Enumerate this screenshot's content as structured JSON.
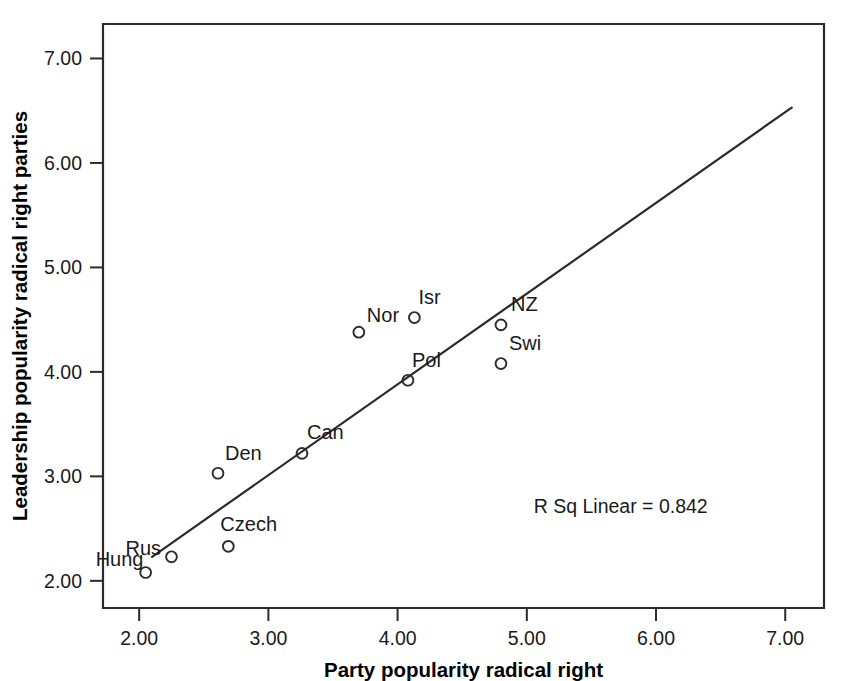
{
  "chart_data": {
    "type": "scatter",
    "title": "",
    "xlabel": "Party popularity radical right",
    "ylabel": "Leadership popularity radical right parties",
    "xlim": [
      1.72,
      7.3
    ],
    "ylim": [
      1.74,
      7.33
    ],
    "xticks": [
      "2.00",
      "3.00",
      "4.00",
      "5.00",
      "6.00",
      "7.00"
    ],
    "xtick_values": [
      2,
      3,
      4,
      5,
      6,
      7
    ],
    "yticks": [
      "2.00",
      "3.00",
      "4.00",
      "5.00",
      "6.00",
      "7.00"
    ],
    "ytick_values": [
      2,
      3,
      4,
      5,
      6,
      7
    ],
    "grid": false,
    "legend": null,
    "points": [
      {
        "label": "Hung",
        "x": 2.05,
        "y": 2.08,
        "label_dx": -50,
        "label_dy": -6
      },
      {
        "label": "Rus",
        "x": 2.25,
        "y": 2.23,
        "label_dx": -46,
        "label_dy": -2
      },
      {
        "label": "Czech",
        "x": 2.69,
        "y": 2.33,
        "label_dx": -8,
        "label_dy": -15
      },
      {
        "label": "Den",
        "x": 2.61,
        "y": 3.03,
        "label_dx": 7,
        "label_dy": -13
      },
      {
        "label": "Can",
        "x": 3.26,
        "y": 3.22,
        "label_dx": 5,
        "label_dy": -14
      },
      {
        "label": "Pol",
        "x": 4.08,
        "y": 3.92,
        "label_dx": 4,
        "label_dy": -13
      },
      {
        "label": "Nor",
        "x": 3.7,
        "y": 4.38,
        "label_dx": 8,
        "label_dy": -10
      },
      {
        "label": "Isr",
        "x": 4.13,
        "y": 4.52,
        "label_dx": 4,
        "label_dy": -14
      },
      {
        "label": "NZ",
        "x": 4.8,
        "y": 4.45,
        "label_dx": 10,
        "label_dy": -14
      },
      {
        "label": "Swi",
        "x": 4.8,
        "y": 4.08,
        "label_dx": 8,
        "label_dy": -14
      }
    ],
    "fit_line": {
      "x_start": 2.1,
      "y_start": 2.23,
      "x_end": 7.05,
      "y_end": 6.53
    },
    "annotation": "R Sq Linear = 0.842",
    "annotation_x": 6.4,
    "annotation_y": 2.65,
    "colors": {
      "axis": "#2b2b2b",
      "marker": "#2b2b2b",
      "fit_line": "#2b2b2b",
      "text": "#1a1a1a",
      "background": "#ffffff"
    }
  }
}
